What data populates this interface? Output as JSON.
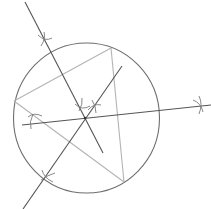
{
  "diagram": {
    "elements": {
      "circle": "circumcircle",
      "triangle": [
        "vertex-top",
        "vertex-left",
        "vertex-bottom"
      ],
      "bisectors": [
        "bisector-left-side",
        "bisector-bottom-side",
        "bisector-right-side"
      ],
      "construction_arcs": 6,
      "circumcenter": "intersection of bisectors"
    },
    "colors": {
      "circle": "#6e6e6e",
      "triangle": "#b4b4b4",
      "bisector": "#555555",
      "arcs": "#7a7a7a"
    }
  }
}
